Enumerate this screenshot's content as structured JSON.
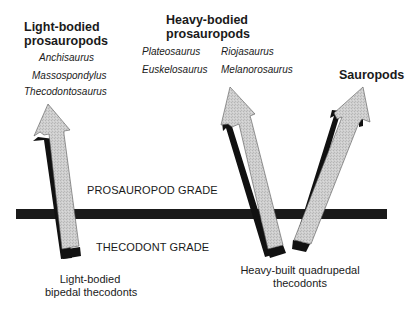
{
  "diagram": {
    "groups": {
      "light_prosauropods": {
        "title_line1": "Light-bodied",
        "title_line2": "prosauropods",
        "genera": [
          "Anchisaurus",
          "Massospondylus",
          "Thecodontosaurus"
        ]
      },
      "heavy_prosauropods": {
        "title_line1": "Heavy-bodied",
        "title_line2": "prosauropods",
        "genera_col1": [
          "Plateosaurus",
          "Euskelosaurus"
        ],
        "genera_col2": [
          "Riojasaurus",
          "Melanorosaurus"
        ]
      },
      "sauropods": {
        "title": "Sauropods"
      }
    },
    "grades": {
      "upper": "PROSAUROPOD GRADE",
      "lower": "THECODONT GRADE"
    },
    "origins": {
      "light": {
        "line1": "Light-bodied",
        "line2": "bipedal thecodonts"
      },
      "heavy": {
        "line1": "Heavy-built quadrupedal",
        "line2": "thecodonts"
      }
    },
    "arrows": [
      {
        "name": "light-bipedal-to-light-prosauropods",
        "from": "Light-bodied bipedal thecodonts",
        "to": "Light-bodied prosauropods"
      },
      {
        "name": "heavy-quadrupedal-to-heavy-prosauropods",
        "from": "Heavy-built quadrupedal thecodonts",
        "to": "Heavy-bodied prosauropods"
      },
      {
        "name": "heavy-quadrupedal-to-sauropods",
        "from": "Heavy-built quadrupedal thecodonts",
        "to": "Sauropods"
      }
    ],
    "colors": {
      "arrow_fill": "#c8c8c8",
      "arrow_shadow": "#111111",
      "grade_bar": "#1a1a1a",
      "text": "#1a1a1a"
    }
  }
}
